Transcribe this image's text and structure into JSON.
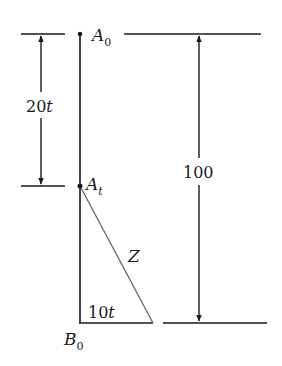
{
  "diagram": {
    "labels": {
      "a0_main": "A",
      "a0_sub": "0",
      "at_main": "A",
      "at_sub": "t",
      "b0_main": "B",
      "b0_sub": "0",
      "left_dimension": "20t",
      "right_dimension": "100",
      "hypotenuse": "Z",
      "base": "10t"
    },
    "colors": {
      "line": "#1a1a1a",
      "hypotenuse": "#666666"
    }
  }
}
